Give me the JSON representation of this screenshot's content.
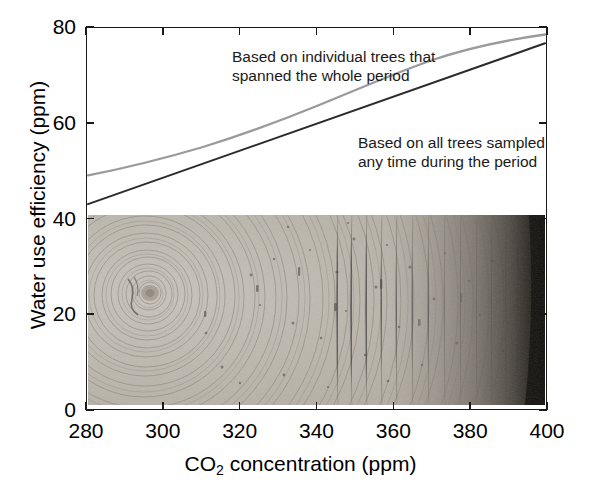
{
  "figure": {
    "caption_present": false
  },
  "axes": {
    "x": {
      "title_prefix": "CO",
      "title_sub": "2",
      "title_suffix": " concentration (ppm)",
      "ticks": [
        280,
        300,
        320,
        340,
        360,
        380,
        400
      ],
      "min": 280,
      "max": 400
    },
    "y": {
      "title": "Water use efficiency (ppm)",
      "ticks": [
        0,
        20,
        40,
        60,
        80
      ],
      "min": 0,
      "max": 80
    }
  },
  "annotations": {
    "individual": {
      "line1": "Based on individual trees that",
      "line2": "spanned the whole period"
    },
    "all": {
      "line1": "Based on all trees sampled",
      "line2": "any time during the period"
    }
  },
  "inset": {
    "name": "tree-ring-cross-section-photograph",
    "description": "Grayscale photograph of a tree trunk cross-section showing concentric annual growth rings, pith near the left, dark bark at the right edge"
  },
  "colors": {
    "axis": "#1a1a1a",
    "series_individual": "#2b2b2b",
    "series_all": "#9a9a9a",
    "text": "#000000",
    "annotation_text": "#1a1a1a"
  },
  "chart_data": {
    "type": "line",
    "title": "",
    "xlabel": "CO2 concentration (ppm)",
    "ylabel": "Water use efficiency (ppm)",
    "xlim": [
      280,
      400
    ],
    "ylim": [
      0,
      80
    ],
    "xticks": [
      280,
      300,
      320,
      340,
      360,
      380,
      400
    ],
    "yticks": [
      0,
      20,
      40,
      60,
      80
    ],
    "grid": false,
    "legend": "inline-annotations",
    "series": [
      {
        "name": "Based on individual trees that spanned the whole period",
        "color": "#2b2b2b",
        "x": [
          280,
          290,
          300,
          310,
          320,
          330,
          340,
          350,
          360,
          370,
          380,
          390,
          400
        ],
        "values": [
          43.0,
          45.8,
          48.6,
          51.4,
          54.2,
          57.0,
          59.8,
          62.6,
          65.4,
          68.2,
          71.0,
          73.8,
          76.6
        ]
      },
      {
        "name": "Based on all trees sampled any time during the period",
        "color": "#9a9a9a",
        "x": [
          280,
          290,
          300,
          310,
          320,
          330,
          340,
          350,
          360,
          370,
          380,
          390,
          400
        ],
        "values": [
          49.0,
          50.3,
          51.7,
          53.2,
          54.9,
          56.8,
          58.9,
          61.2,
          63.7,
          66.4,
          69.3,
          72.4,
          75.8
        ]
      }
    ],
    "crossing_point": {
      "x": 326,
      "y": 56
    }
  }
}
